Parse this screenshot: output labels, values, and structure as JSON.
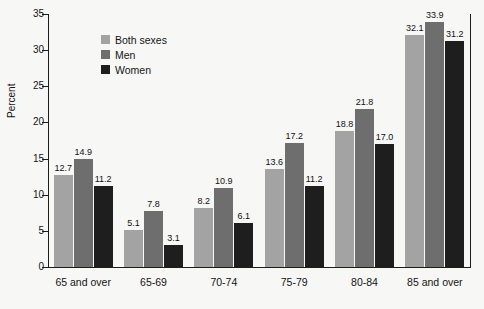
{
  "chart_data": {
    "type": "bar",
    "title": "",
    "xlabel": "",
    "ylabel": "Percent",
    "ylim": [
      0,
      35
    ],
    "yticks": [
      0,
      5,
      10,
      15,
      20,
      25,
      30,
      35
    ],
    "grid": false,
    "legend_position": "top-left-inside",
    "categories": [
      "65 and over",
      "65-69",
      "70-74",
      "75-79",
      "80-84",
      "85 and over"
    ],
    "series": [
      {
        "name": "Both sexes",
        "color": "#a3a3a3",
        "values": [
          12.7,
          5.1,
          8.2,
          13.6,
          18.8,
          32.1
        ],
        "labels": [
          "12.7",
          "5.1",
          "8.2",
          "13.6",
          "18.8",
          "32.1"
        ]
      },
      {
        "name": "Men",
        "color": "#6e6e6e",
        "values": [
          14.9,
          7.8,
          10.9,
          17.2,
          21.8,
          33.9
        ],
        "labels": [
          "14.9",
          "7.8",
          "10.9",
          "17.2",
          "21.8",
          "33.9"
        ]
      },
      {
        "name": "Women",
        "color": "#1e1e1e",
        "values": [
          11.2,
          3.1,
          6.1,
          11.2,
          17.0,
          31.2
        ],
        "labels": [
          "11.2",
          "3.1",
          "6.1",
          "11.2",
          "17.0",
          "31.2"
        ]
      }
    ]
  },
  "axis": {
    "y_title": "Percent",
    "y_tick_labels": [
      "0",
      "5",
      "10",
      "15",
      "20",
      "25",
      "30",
      "35"
    ]
  },
  "legend": {
    "entries": [
      {
        "label": "Both sexes",
        "color": "#a3a3a3"
      },
      {
        "label": "Men",
        "color": "#6e6e6e"
      },
      {
        "label": "Women",
        "color": "#1e1e1e"
      }
    ]
  }
}
